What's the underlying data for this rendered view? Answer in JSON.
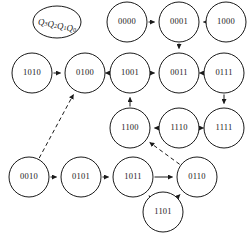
{
  "diagram": {
    "kind": "state-transition-diagram",
    "legend": {
      "text": "Q3Q2Q1Q0",
      "base": "Q",
      "subscripts": [
        "3",
        "2",
        "1",
        "0"
      ]
    },
    "colors": {
      "stroke": "#1a1a1a",
      "fill": "#ffffff",
      "background": "#ffffff"
    },
    "nodes": [
      {
        "id": "legend",
        "label": "Q3Q2Q1Q0",
        "cx": 57,
        "cy": 22,
        "r": 20,
        "rx": 24,
        "ry": 16,
        "type": "legend"
      },
      {
        "id": "n1010",
        "label": "1010",
        "cx": 32,
        "cy": 73,
        "r": 20
      },
      {
        "id": "n0100",
        "label": "0100",
        "cx": 85,
        "cy": 73,
        "r": 20
      },
      {
        "id": "n0000",
        "label": "0000",
        "cx": 127,
        "cy": 22,
        "r": 20
      },
      {
        "id": "n0001",
        "label": "0001",
        "cx": 179,
        "cy": 22,
        "r": 20
      },
      {
        "id": "n1000",
        "label": "1000",
        "cx": 226,
        "cy": 22,
        "r": 20
      },
      {
        "id": "n1001",
        "label": "1001",
        "cx": 130,
        "cy": 73,
        "r": 20
      },
      {
        "id": "n0011",
        "label": "0011",
        "cx": 179,
        "cy": 73,
        "r": 20
      },
      {
        "id": "n0111",
        "label": "0111",
        "cx": 224,
        "cy": 73,
        "r": 20
      },
      {
        "id": "n1100",
        "label": "1100",
        "cx": 130,
        "cy": 128,
        "r": 20
      },
      {
        "id": "n1110",
        "label": "1110",
        "cx": 179,
        "cy": 128,
        "r": 20
      },
      {
        "id": "n1111",
        "label": "1111",
        "cx": 224,
        "cy": 128,
        "r": 20
      },
      {
        "id": "n0010",
        "label": "0010",
        "cx": 29,
        "cy": 177,
        "r": 20
      },
      {
        "id": "n0101",
        "label": "0101",
        "cx": 81,
        "cy": 177,
        "r": 20
      },
      {
        "id": "n1011",
        "label": "1011",
        "cx": 133,
        "cy": 177,
        "r": 20
      },
      {
        "id": "n0110",
        "label": "0110",
        "cx": 197,
        "cy": 177,
        "r": 20
      },
      {
        "id": "n1101",
        "label": "1101",
        "cx": 163,
        "cy": 212,
        "r": 20
      }
    ],
    "edges": [
      {
        "from": "n1010",
        "to": "n0100",
        "style": "solid"
      },
      {
        "from": "n0100",
        "to": "n1001",
        "style": "solid"
      },
      {
        "from": "n0000",
        "to": "n0001",
        "style": "solid"
      },
      {
        "from": "n1000",
        "to": "n0001",
        "style": "solid"
      },
      {
        "from": "n0001",
        "to": "n0011",
        "style": "solid"
      },
      {
        "from": "n1001",
        "to": "n0011",
        "style": "solid"
      },
      {
        "from": "n0011",
        "to": "n0111",
        "style": "solid"
      },
      {
        "from": "n0111",
        "to": "n1111",
        "style": "solid"
      },
      {
        "from": "n1111",
        "to": "n1110",
        "style": "solid"
      },
      {
        "from": "n1110",
        "to": "n1100",
        "style": "solid"
      },
      {
        "from": "n1100",
        "to": "n1001",
        "style": "solid"
      },
      {
        "from": "n0010",
        "to": "n0101",
        "style": "solid"
      },
      {
        "from": "n0101",
        "to": "n1011",
        "style": "solid"
      },
      {
        "from": "n1011",
        "to": "n0110",
        "style": "solid"
      },
      {
        "from": "n1101",
        "to": "n1011",
        "style": "solid"
      },
      {
        "from": "n1101",
        "to": "n0110",
        "style": "solid"
      },
      {
        "from": "n0010",
        "to": "n0100",
        "style": "dashed"
      },
      {
        "from": "n0110",
        "to": "n1100",
        "style": "dashed"
      }
    ]
  }
}
